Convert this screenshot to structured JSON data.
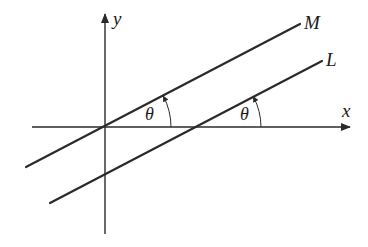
{
  "diagram": {
    "type": "geometry",
    "colors": {
      "stroke": "#2a2a2a",
      "text": "#1a1a1a",
      "background": "#ffffff"
    },
    "axes": {
      "x_label": "x",
      "y_label": "y"
    },
    "lines": [
      {
        "name": "M",
        "label": "M",
        "passes_through_origin": true
      },
      {
        "name": "L",
        "label": "L",
        "passes_through_origin": false
      }
    ],
    "angles": [
      {
        "label": "θ",
        "between": [
          "M",
          "x-axis"
        ],
        "vertex": "origin"
      },
      {
        "label": "θ",
        "between": [
          "L",
          "x-axis"
        ],
        "vertex": "L x-intercept"
      }
    ]
  }
}
